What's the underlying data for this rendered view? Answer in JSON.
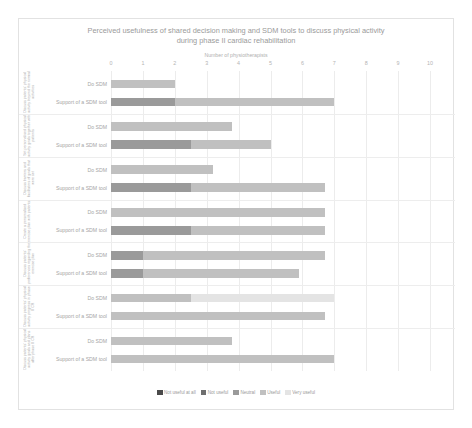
{
  "chart_data": {
    "type": "bar",
    "orientation": "horizontal",
    "stacked": true,
    "title": "Perceived usefulness of shared decision making and SDM tools to discuss physical activity during phase II cardiac rehabilitation",
    "title_line1": "Perceived usefulness of shared decision making and SDM tools to discuss physical activity",
    "title_line2": "during phase II cardiac rehabilitation",
    "xlabel": "Number of physiotherapists",
    "ylabel": "",
    "xlim": [
      0,
      10
    ],
    "xticks": [
      0,
      1,
      2,
      3,
      4,
      5,
      6,
      7,
      8,
      9,
      10
    ],
    "xtick_labels": [
      "0",
      "1",
      "2",
      "3",
      "4",
      "5",
      "6",
      "7",
      "8",
      "9",
      "10"
    ],
    "grid": true,
    "legend_position": "bottom",
    "legend": [
      {
        "label": "Not useful at all",
        "color": "#4a4a4a"
      },
      {
        "label": "Not useful",
        "color": "#6e6e6e"
      },
      {
        "label": "Neutral",
        "color": "#9a9a9a"
      },
      {
        "label": "Useful",
        "color": "#c0c0c0"
      },
      {
        "label": "Very useful",
        "color": "#e4e4e4"
      }
    ],
    "series": [
      {
        "name": "Not useful at all",
        "color": "#4a4a4a"
      },
      {
        "name": "Not useful",
        "color": "#6e6e6e"
      },
      {
        "name": "Neutral",
        "color": "#9a9a9a"
      },
      {
        "name": "Useful",
        "color": "#c0c0c0"
      },
      {
        "name": "Very useful",
        "color": "#e4e4e4"
      }
    ],
    "row_labels": {
      "do_sdm": "Do SDM",
      "support_tool": "Support of a SDM tool"
    },
    "groups": [
      {
        "label": "Discuss patients' physical activity beyond the normal activities",
        "rows": [
          {
            "label": "Do SDM",
            "values": [
              0,
              0,
              0,
              2,
              0
            ]
          },
          {
            "label": "Support of a SDM tool",
            "values": [
              0,
              0,
              2,
              5,
              0
            ]
          }
        ]
      },
      {
        "label": "Set personalised physical activity goals together with patients",
        "rows": [
          {
            "label": "Do SDM",
            "values": [
              0,
              0,
              0,
              3.8,
              0
            ]
          },
          {
            "label": "Support of a SDM tool",
            "values": [
              0,
              0,
              2.5,
              2.5,
              0
            ]
          }
        ]
      },
      {
        "label": "Discuss barriers and facilitators of goals that were set",
        "rows": [
          {
            "label": "Do SDM",
            "values": [
              0,
              0,
              0,
              3.2,
              0
            ]
          },
          {
            "label": "Support of a SDM tool",
            "values": [
              0,
              0,
              2.5,
              4.2,
              0
            ]
          }
        ]
      },
      {
        "label": "Create a personalised exercise plan with patients",
        "rows": [
          {
            "label": "Do SDM",
            "values": [
              0,
              0,
              0,
              6.7,
              0
            ]
          },
          {
            "label": "Support of a SDM tool",
            "values": [
              0,
              0,
              2.5,
              4.2,
              0
            ]
          }
        ]
      },
      {
        "label": "Discuss patients' preferences regarding the exercise plan",
        "rows": [
          {
            "label": "Do SDM",
            "values": [
              0,
              0,
              1,
              5.7,
              0
            ]
          },
          {
            "label": "Support of a SDM tool",
            "values": [
              0,
              0,
              1,
              4.9,
              0
            ]
          }
        ]
      },
      {
        "label": "Discuss patients' physical activity progress in phase II CR",
        "rows": [
          {
            "label": "Do SDM",
            "values": [
              0,
              0,
              0,
              2.5,
              4.5
            ]
          },
          {
            "label": "Support of a SDM tool",
            "values": [
              0,
              0,
              0,
              6.7,
              0
            ]
          }
        ]
      },
      {
        "label": "Discuss patients' physical activity goals and plans after phase II CR",
        "rows": [
          {
            "label": "Do SDM",
            "values": [
              0,
              0,
              0,
              3.8,
              0
            ]
          },
          {
            "label": "Support of a SDM tool",
            "values": [
              0,
              0,
              0,
              7,
              0
            ]
          }
        ]
      }
    ]
  }
}
